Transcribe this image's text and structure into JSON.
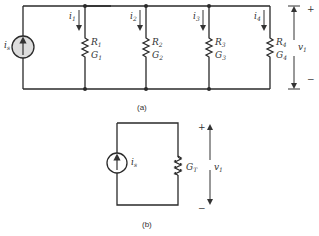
{
  "figure_a": {
    "caption": "(a)",
    "source": {
      "label": "i",
      "sub": "s"
    },
    "branches": [
      {
        "current": "i",
        "current_sub": "1",
        "r": "R",
        "g": "G",
        "sub": "1"
      },
      {
        "current": "i",
        "current_sub": "2",
        "r": "R",
        "g": "G",
        "sub": "2"
      },
      {
        "current": "i",
        "current_sub": "3",
        "r": "R",
        "g": "G",
        "sub": "3"
      },
      {
        "current": "i",
        "current_sub": "4",
        "r": "R",
        "g": "G",
        "sub": "4"
      }
    ],
    "voltage": {
      "label": "v",
      "sub": "1",
      "plus": "+",
      "minus": "−"
    }
  },
  "figure_b": {
    "caption": "(b)",
    "source": {
      "label": "i",
      "sub": "s"
    },
    "conductance": {
      "label": "G",
      "sub": "T"
    },
    "voltage": {
      "label": "v",
      "sub": "1",
      "plus": "+",
      "minus": "−"
    }
  }
}
